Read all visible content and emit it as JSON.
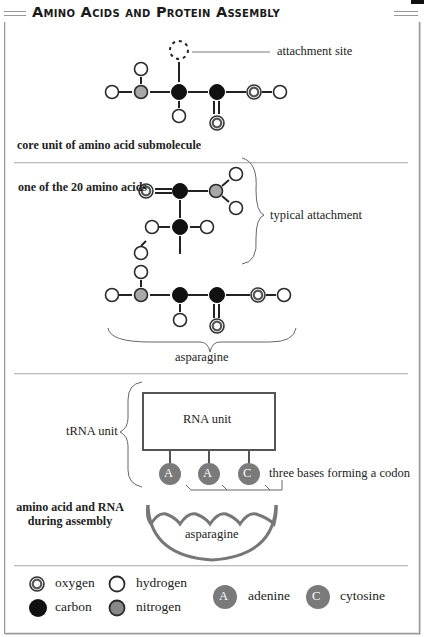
{
  "title": "Amino Acids and Protein Assembly",
  "section1": {
    "caption": "core unit of amino acid submolecule",
    "attachment_label": "attachment site"
  },
  "section2": {
    "caption": "one of the 20 amino acids",
    "attachment_label": "typical attachment",
    "molecule_label": "asparagine"
  },
  "section3": {
    "trna_label": "tRNA unit",
    "rna_box_label": "RNA unit",
    "bases": [
      "A",
      "A",
      "C"
    ],
    "codon_label": "three bases forming a codon",
    "caption_line1": "amino acid and RNA",
    "caption_line2": "during assembly",
    "amino_acid_label": "asparagine"
  },
  "legend": {
    "oxygen": "oxygen",
    "hydrogen": "hydrogen",
    "carbon": "carbon",
    "nitrogen": "nitrogen",
    "adenine_symbol": "A",
    "adenine": "adenine",
    "cytosine_symbol": "C",
    "cytosine": "cytosine"
  },
  "colors": {
    "carbon": "#111111",
    "nitrogen": "#a8a8a8",
    "hydrogen": "#ffffff",
    "oxygen_ring": "#555555",
    "base_fill": "#7a7a7a",
    "outline": "#2a2a2a"
  }
}
